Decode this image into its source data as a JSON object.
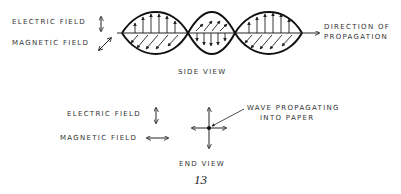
{
  "side_view": {
    "legend_electric": "ELECTRIC FIELD",
    "legend_magnetic": "MAGNETIC FIELD",
    "direction_label_line1": "DIRECTION OF",
    "direction_label_line2": "PROPAGATION",
    "caption": "SIDE VIEW"
  },
  "end_view": {
    "legend_electric": "ELECTRIC FIELD",
    "legend_magnetic": "MAGNETIC FIELD",
    "annotation_line1": "WAVE PROPAGATING",
    "annotation_line2": "INTO PAPER",
    "caption": "END VIEW"
  },
  "page_number": "13",
  "colors": {
    "ink": "#222222",
    "background": "#ffffff"
  }
}
